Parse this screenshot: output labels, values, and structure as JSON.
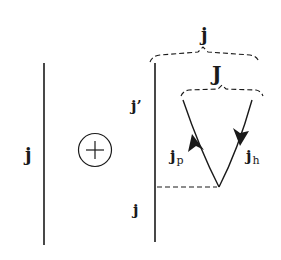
{
  "diagram": {
    "type": "angular-momentum-coupling",
    "colors": {
      "line": "#1a1a1a",
      "background": "#ffffff"
    },
    "left_line": {
      "label": "j"
    },
    "operator": {
      "symbol": "+",
      "shape": "circled-plus"
    },
    "right_line": {
      "upper_label": "j’",
      "lower_label": "j"
    },
    "outer_brace": {
      "label": "j"
    },
    "inner_brace": {
      "label": "J"
    },
    "particle_line": {
      "label_main": "j",
      "label_sub": "p",
      "arrow_direction": "up"
    },
    "hole_line": {
      "label_main": "j",
      "label_sub": "h",
      "arrow_direction": "down"
    },
    "interaction_line": {
      "style": "dashed"
    }
  }
}
